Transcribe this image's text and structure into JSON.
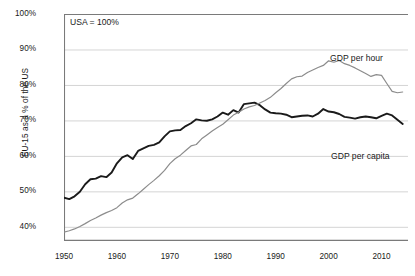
{
  "chart_data": {
    "type": "line",
    "title": "",
    "subtitle": "",
    "xlabel": "",
    "ylabel": "EU-15 as a % of the US",
    "annotations": [
      {
        "name": "normalisation-note",
        "text": "USA = 100%"
      },
      {
        "name": "series-label-gdp-per-hour",
        "text": "GDP per hour"
      },
      {
        "name": "series-label-gdp-per-capita",
        "text": "GDP per capita"
      }
    ],
    "xlim": [
      1950,
      2015
    ],
    "ylim": [
      36,
      100
    ],
    "xticks": [
      1950,
      1960,
      1970,
      1980,
      1990,
      2000,
      2010
    ],
    "xtick_labels": [
      "1950",
      "1960",
      "1970",
      "1980",
      "1990",
      "2000",
      "2010"
    ],
    "yticks": [
      40,
      50,
      60,
      70,
      80,
      90,
      100
    ],
    "ytick_labels": [
      "40%",
      "50%",
      "60%",
      "70%",
      "80%",
      "90%",
      "100%"
    ],
    "grid": "horizontal",
    "legend_position": "inline-right",
    "x": [
      1950,
      1951,
      1952,
      1953,
      1954,
      1955,
      1956,
      1957,
      1958,
      1959,
      1960,
      1961,
      1962,
      1963,
      1964,
      1965,
      1966,
      1967,
      1968,
      1969,
      1970,
      1971,
      1972,
      1973,
      1974,
      1975,
      1976,
      1977,
      1978,
      1979,
      1980,
      1981,
      1982,
      1983,
      1984,
      1985,
      1986,
      1987,
      1988,
      1989,
      1990,
      1991,
      1992,
      1993,
      1994,
      1995,
      1996,
      1997,
      1998,
      1999,
      2000,
      2001,
      2002,
      2003,
      2004,
      2005,
      2006,
      2007,
      2008,
      2009,
      2010,
      2011,
      2012,
      2013,
      2014
    ],
    "series": [
      {
        "name": "GDP per capita",
        "color": "#1a1a1a",
        "unit": "% of US",
        "values": [
          48.2,
          47.8,
          48.6,
          49.9,
          52.0,
          53.4,
          53.6,
          54.3,
          54.0,
          55.3,
          57.9,
          59.6,
          60.2,
          59.1,
          61.4,
          62.1,
          62.8,
          63.1,
          63.8,
          65.5,
          66.9,
          67.2,
          67.3,
          68.4,
          69.2,
          70.3,
          70.0,
          69.9,
          70.3,
          71.1,
          72.2,
          71.6,
          72.9,
          72.2,
          74.6,
          74.8,
          75.0,
          74.3,
          73.1,
          72.2,
          72.0,
          71.9,
          71.6,
          70.9,
          71.1,
          71.3,
          71.4,
          71.1,
          71.9,
          73.2,
          72.5,
          72.3,
          71.8,
          71.0,
          70.8,
          70.5,
          70.9,
          71.1,
          70.9,
          70.6,
          71.3,
          71.9,
          71.4,
          70.2,
          69.0
        ]
      },
      {
        "name": "GDP per hour",
        "color": "#8c8c8c",
        "unit": "% of US",
        "values": [
          38.5,
          38.9,
          39.4,
          40.1,
          40.9,
          41.8,
          42.5,
          43.3,
          44.0,
          44.6,
          45.4,
          46.7,
          47.6,
          48.1,
          49.3,
          50.6,
          51.9,
          53.1,
          54.4,
          55.9,
          57.8,
          59.2,
          60.2,
          61.5,
          62.8,
          63.2,
          64.8,
          65.9,
          67.0,
          68.0,
          68.9,
          70.2,
          71.5,
          72.3,
          73.2,
          73.8,
          74.2,
          74.9,
          75.6,
          76.5,
          77.8,
          79.0,
          80.4,
          81.7,
          82.3,
          82.5,
          83.5,
          84.2,
          84.9,
          85.5,
          86.8,
          86.4,
          86.9,
          86.0,
          85.5,
          84.8,
          84.0,
          83.2,
          82.4,
          82.9,
          82.7,
          80.4,
          78.2,
          77.8,
          78.0
        ]
      }
    ]
  }
}
